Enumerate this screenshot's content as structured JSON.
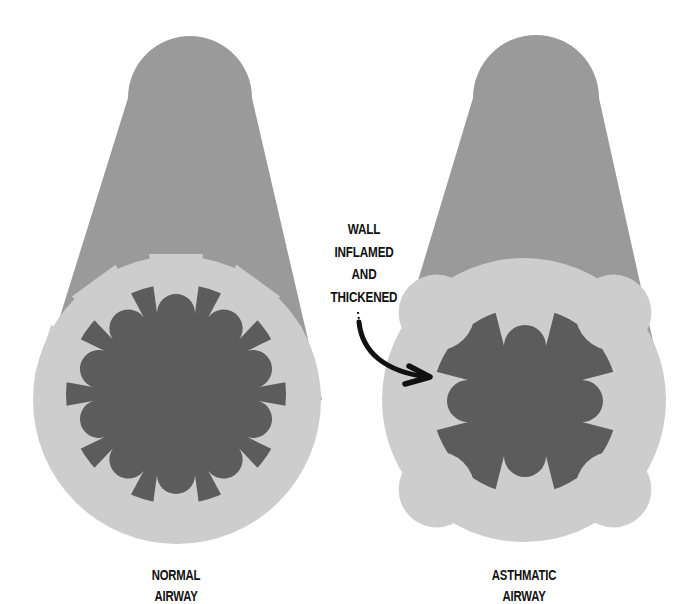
{
  "colors": {
    "background": "#ffffff",
    "tube": "#9a9a9a",
    "wall": "#cdcdcd",
    "lumen": "#5c5c5c",
    "text": "#111111",
    "arrow": "#111111"
  },
  "annotation": {
    "lines": [
      "WALL",
      "INFLAMED",
      "AND",
      "THICKENED"
    ]
  },
  "airways": [
    {
      "id": "normal",
      "label_lines": [
        "NORMAL",
        "AIRWAY"
      ],
      "folds": 10,
      "lumen_state": "open"
    },
    {
      "id": "asthmatic",
      "label_lines": [
        "ASTHMATIC",
        "AIRWAY"
      ],
      "folds": 4,
      "lumen_state": "narrowed"
    }
  ]
}
